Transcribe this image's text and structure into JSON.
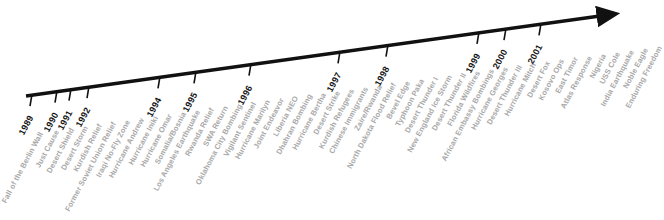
{
  "figure": {
    "name": "military-operations-timeline",
    "background_color": "#ffffff",
    "axis_color": "#111111",
    "year_label_color": "#141414",
    "event_label_color": "#a9a9a9",
    "arrow_direction": "up-right"
  },
  "chart_data": {
    "type": "timeline",
    "title": "",
    "xlabel": "",
    "ylabel": "",
    "axis": {
      "start": {
        "x": 26,
        "y": 96
      },
      "end": {
        "x": 608,
        "y": 15
      },
      "has_arrowhead": true
    },
    "categories": [
      "1989",
      "1990",
      "1991",
      "1992",
      "1994",
      "1995",
      "1996",
      "1997",
      "1998",
      "1999",
      "2000",
      "2001"
    ],
    "years": [
      {
        "label": "1989",
        "x": 32
      },
      {
        "label": "1990",
        "x": 57
      },
      {
        "label": "1991",
        "x": 71
      },
      {
        "label": "1992",
        "x": 89
      },
      {
        "label": "1994",
        "x": 160
      },
      {
        "label": "1995",
        "x": 196
      },
      {
        "label": "1996",
        "x": 251
      },
      {
        "label": "1997",
        "x": 340
      },
      {
        "label": "1998",
        "x": 388
      },
      {
        "label": "1999",
        "x": 479
      },
      {
        "label": "2000",
        "x": 506
      },
      {
        "label": "2001",
        "x": 541
      }
    ],
    "events": [
      {
        "label": "Fall of the Berlin Wall",
        "x": 41
      },
      {
        "label": "Just Cause",
        "x": 57
      },
      {
        "label": "Desert Shield",
        "x": 72
      },
      {
        "label": "Desert Storm",
        "x": 86
      },
      {
        "label": "Kurdish Relief",
        "x": 100
      },
      {
        "label": "Former Soviet Union Relief",
        "x": 114
      },
      {
        "label": "Iraqi No-Fly Zone",
        "x": 128
      },
      {
        "label": "Hurricane Andrew",
        "x": 142
      },
      {
        "label": "Hurricane Iniki",
        "x": 156
      },
      {
        "label": "Hurricane Omar",
        "x": 170
      },
      {
        "label": "Somalia/Bosnia",
        "x": 184
      },
      {
        "label": "Los Angeles Earthquake",
        "x": 198
      },
      {
        "label": "Rwanda Relief",
        "x": 212
      },
      {
        "label": "SWA Return",
        "x": 226
      },
      {
        "label": "Oklahoma City Bombing",
        "x": 240
      },
      {
        "label": "Vigilant Sentinel",
        "x": 254
      },
      {
        "label": "Hurricane Marilyn",
        "x": 268
      },
      {
        "label": "Joint Endeavor",
        "x": 282
      },
      {
        "label": "Liberia NEO",
        "x": 296
      },
      {
        "label": "Dhahran Bombing",
        "x": 310
      },
      {
        "label": "Hurricane Bertha",
        "x": 324
      },
      {
        "label": "Desert Strike",
        "x": 338
      },
      {
        "label": "Kurdish Refugees",
        "x": 352
      },
      {
        "label": "Chinese Immigrants",
        "x": 366
      },
      {
        "label": "Zaire/Rwanda",
        "x": 380
      },
      {
        "label": "North Dakota Flood Relief",
        "x": 394
      },
      {
        "label": "Bevel Edge",
        "x": 408
      },
      {
        "label": "Typhoon Paka",
        "x": 422
      },
      {
        "label": "Desert Thunder I",
        "x": 436
      },
      {
        "label": "New England Ice Storm",
        "x": 450
      },
      {
        "label": "Desert Thunder II",
        "x": 464
      },
      {
        "label": "Florida Wildfires",
        "x": 478
      },
      {
        "label": "African Embassy Bombings",
        "x": 492
      },
      {
        "label": "Hurricane Georges",
        "x": 506
      },
      {
        "label": "Desert Thunder III",
        "x": 520
      },
      {
        "label": "Hurricane Mitch",
        "x": 534
      },
      {
        "label": "Desert Fox",
        "x": 548
      },
      {
        "label": "Kosovo Ops",
        "x": 562
      },
      {
        "label": "East Timor",
        "x": 576
      },
      {
        "label": "Atlas Response",
        "x": 590
      },
      {
        "label": "Nigeria",
        "x": 604
      },
      {
        "label": "USS Cole",
        "x": 618
      },
      {
        "label": "India Earthquake",
        "x": 632
      },
      {
        "label": "Noble Eagle",
        "x": 646
      },
      {
        "label": "Enduring Freedom",
        "x": 660
      }
    ]
  }
}
